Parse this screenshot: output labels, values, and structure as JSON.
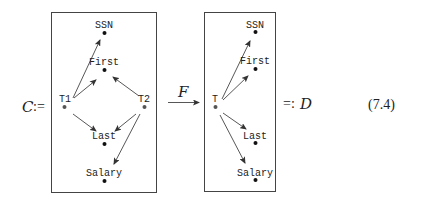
{
  "equation": {
    "lhs_symbol": "C",
    "assign_left": ":=",
    "functor_label": "F",
    "assign_right": "=:",
    "rhs_symbol": "D",
    "number": "(7.4)"
  },
  "left_box": {
    "nodes": {
      "ssn": "SSN",
      "first": "First",
      "t1": "T1",
      "t2": "T2",
      "last": "Last",
      "salary": "Salary"
    },
    "arrows": [
      [
        "T1",
        "SSN"
      ],
      [
        "T1",
        "First"
      ],
      [
        "T1",
        "Last"
      ],
      [
        "T2",
        "First"
      ],
      [
        "T2",
        "Last"
      ],
      [
        "T2",
        "Salary"
      ]
    ]
  },
  "right_box": {
    "nodes": {
      "ssn": "SSN",
      "first": "First",
      "t": "T",
      "last": "Last",
      "salary": "Salary"
    },
    "arrows": [
      [
        "T",
        "SSN"
      ],
      [
        "T",
        "First"
      ],
      [
        "T",
        "Last"
      ],
      [
        "T",
        "Salary"
      ]
    ]
  }
}
